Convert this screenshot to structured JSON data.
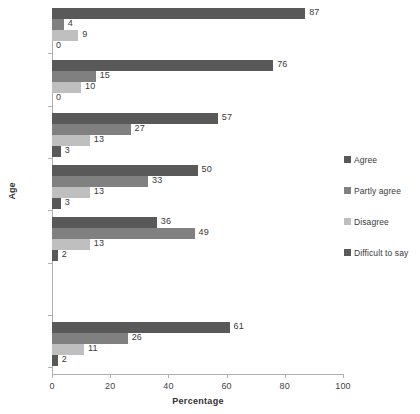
{
  "chart_data": {
    "type": "bar",
    "orientation": "horizontal",
    "title": "",
    "xlabel": "Percentage",
    "ylabel": "Age",
    "xlim": [
      0,
      100
    ],
    "xticks": [
      0,
      20,
      40,
      60,
      80,
      100
    ],
    "grid": false,
    "legend_position": "right",
    "categories": [
      "51+",
      "41-50",
      "31-40",
      "26-30",
      "18-25",
      "",
      "Total"
    ],
    "series": [
      {
        "name": "Agree",
        "color": "#595959",
        "values": [
          87,
          76,
          57,
          50,
          36,
          null,
          61
        ]
      },
      {
        "name": "Partly agree",
        "color": "#808080",
        "values": [
          4,
          15,
          27,
          33,
          49,
          null,
          26
        ]
      },
      {
        "name": "Disagree",
        "color": "#bfbfbf",
        "values": [
          9,
          10,
          13,
          13,
          13,
          null,
          11
        ]
      },
      {
        "name": "Difficult to say",
        "color": "#595959",
        "values": [
          0,
          0,
          3,
          3,
          2,
          null,
          2
        ]
      }
    ]
  },
  "axes": {
    "x_title": "Percentage",
    "y_title": "Age",
    "x_tick_labels": [
      "0",
      "20",
      "40",
      "60",
      "80",
      "100"
    ]
  },
  "legend": {
    "items": [
      {
        "label": "Agree"
      },
      {
        "label": "Partly agree"
      },
      {
        "label": "Disagree"
      },
      {
        "label": "Difficult to say"
      }
    ]
  },
  "groups": [
    {
      "label": "51+",
      "bars": [
        {
          "series": "Agree",
          "value": 87,
          "value_label": "87"
        },
        {
          "series": "Partly agree",
          "value": 4,
          "value_label": "4"
        },
        {
          "series": "Disagree",
          "value": 9,
          "value_label": "9"
        },
        {
          "series": "Difficult to say",
          "value": 0,
          "value_label": "0"
        }
      ]
    },
    {
      "label": "41-50",
      "bars": [
        {
          "series": "Agree",
          "value": 76,
          "value_label": "76"
        },
        {
          "series": "Partly agree",
          "value": 15,
          "value_label": "15"
        },
        {
          "series": "Disagree",
          "value": 10,
          "value_label": "10"
        },
        {
          "series": "Difficult to say",
          "value": 0,
          "value_label": "0"
        }
      ]
    },
    {
      "label": "31-40",
      "bars": [
        {
          "series": "Agree",
          "value": 57,
          "value_label": "57"
        },
        {
          "series": "Partly agree",
          "value": 27,
          "value_label": "27"
        },
        {
          "series": "Disagree",
          "value": 13,
          "value_label": "13"
        },
        {
          "series": "Difficult to say",
          "value": 3,
          "value_label": "3"
        }
      ]
    },
    {
      "label": "26-30",
      "bars": [
        {
          "series": "Agree",
          "value": 50,
          "value_label": "50"
        },
        {
          "series": "Partly agree",
          "value": 33,
          "value_label": "33"
        },
        {
          "series": "Disagree",
          "value": 13,
          "value_label": "13"
        },
        {
          "series": "Difficult to say",
          "value": 3,
          "value_label": "3"
        }
      ]
    },
    {
      "label": "18-25",
      "bars": [
        {
          "series": "Agree",
          "value": 36,
          "value_label": "36"
        },
        {
          "series": "Partly agree",
          "value": 49,
          "value_label": "49"
        },
        {
          "series": "Disagree",
          "value": 13,
          "value_label": "13"
        },
        {
          "series": "Difficult to say",
          "value": 2,
          "value_label": "2"
        }
      ]
    },
    {
      "label": "",
      "bars": []
    },
    {
      "label": "Total",
      "bars": [
        {
          "series": "Agree",
          "value": 61,
          "value_label": "61"
        },
        {
          "series": "Partly agree",
          "value": 26,
          "value_label": "26"
        },
        {
          "series": "Disagree",
          "value": 11,
          "value_label": "11"
        },
        {
          "series": "Difficult to say",
          "value": 2,
          "value_label": "2"
        }
      ]
    }
  ],
  "colors": {
    "agree": "#595959",
    "partly_agree": "#808080",
    "disagree": "#bfbfbf",
    "difficult_to_say": "#595959",
    "axis": "#b0b0b0",
    "text": "#3a3a3a"
  }
}
